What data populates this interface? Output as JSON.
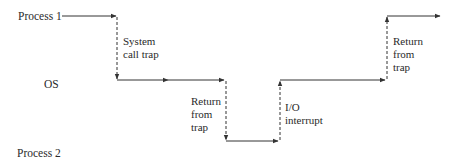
{
  "diagram": {
    "lanes": {
      "process1": "Process 1",
      "os": "OS",
      "process2": "Process 2"
    },
    "transitions": [
      {
        "name": "system-call-trap",
        "lines": [
          "System",
          "call trap"
        ]
      },
      {
        "name": "return-from-trap-1",
        "lines": [
          "Return",
          "from",
          "trap"
        ]
      },
      {
        "name": "io-interrupt",
        "lines": [
          "I/O",
          "interrupt"
        ]
      },
      {
        "name": "return-from-trap-2",
        "lines": [
          "Return",
          "from",
          "trap"
        ]
      }
    ],
    "colors": {
      "line": "#333333",
      "text": "#2a2a2a",
      "background": "#ffffff"
    }
  }
}
